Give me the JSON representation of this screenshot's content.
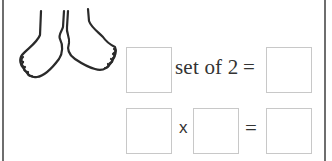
{
  "illustration": {
    "icon": "feet-icon",
    "description": "pair of feet"
  },
  "row1": {
    "input_box_1": "",
    "label": "set of 2",
    "equals": "=",
    "answer_box": ""
  },
  "row2": {
    "factor_box_1": "",
    "operator": "x",
    "factor_box_2": "",
    "equals": "=",
    "product_box": ""
  },
  "colors": {
    "frame": "#6e6e6e",
    "box_border": "#c8c8c8",
    "text": "#333333"
  }
}
